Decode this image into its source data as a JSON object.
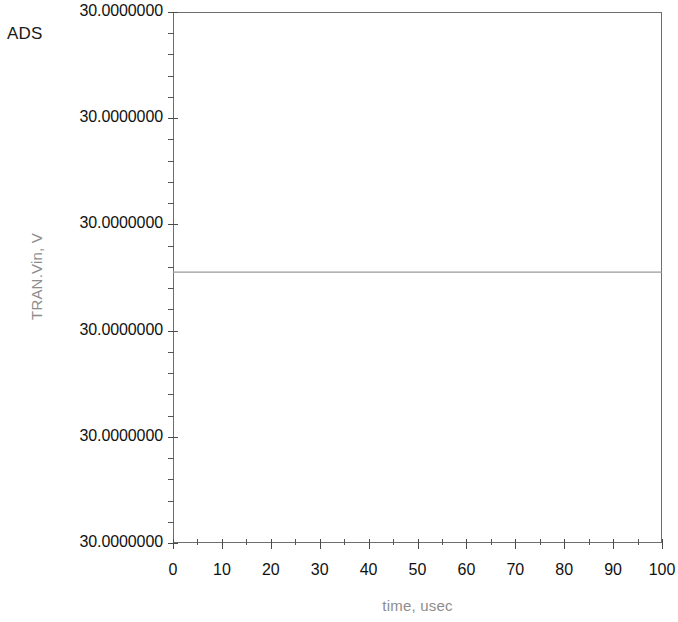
{
  "window": {
    "app_label": "ADS"
  },
  "chart_data": {
    "type": "line",
    "title": "",
    "subtitle": "",
    "xlabel": "time, usec",
    "ylabel": "TRAN.Vin, V",
    "xlim": [
      0,
      100
    ],
    "ylim": [
      0,
      5
    ],
    "grid": false,
    "legend": null,
    "x_ticks": [
      {
        "value": 0,
        "label": "0"
      },
      {
        "value": 10,
        "label": "10"
      },
      {
        "value": 20,
        "label": "20"
      },
      {
        "value": 30,
        "label": "30"
      },
      {
        "value": 40,
        "label": "40"
      },
      {
        "value": 50,
        "label": "50"
      },
      {
        "value": 60,
        "label": "60"
      },
      {
        "value": 70,
        "label": "70"
      },
      {
        "value": 80,
        "label": "80"
      },
      {
        "value": 90,
        "label": "90"
      },
      {
        "value": 100,
        "label": "100"
      }
    ],
    "x_minor_interval": 5,
    "y_ticks": [
      {
        "value": 5,
        "label": "30.0000000"
      },
      {
        "value": 4,
        "label": "30.0000000"
      },
      {
        "value": 3,
        "label": "30.0000000"
      },
      {
        "value": 2,
        "label": "30.0000000"
      },
      {
        "value": 1,
        "label": "30.0000000"
      },
      {
        "value": 0,
        "label": "30.0000000"
      }
    ],
    "y_minor_per_major": 5,
    "series": [
      {
        "name": "TRAN.Vin",
        "color": "#9a9a9a",
        "width": 1.2,
        "x": [
          0,
          10,
          20,
          30,
          40,
          50,
          60,
          70,
          80,
          90,
          100
        ],
        "values": [
          2.55,
          2.55,
          2.55,
          2.55,
          2.55,
          2.55,
          2.55,
          2.55,
          2.55,
          2.55,
          2.55
        ]
      }
    ],
    "frame_color": "#6e6e6e",
    "axis_title_color": "#8d8d8d",
    "tick_label_color": "#111111"
  }
}
